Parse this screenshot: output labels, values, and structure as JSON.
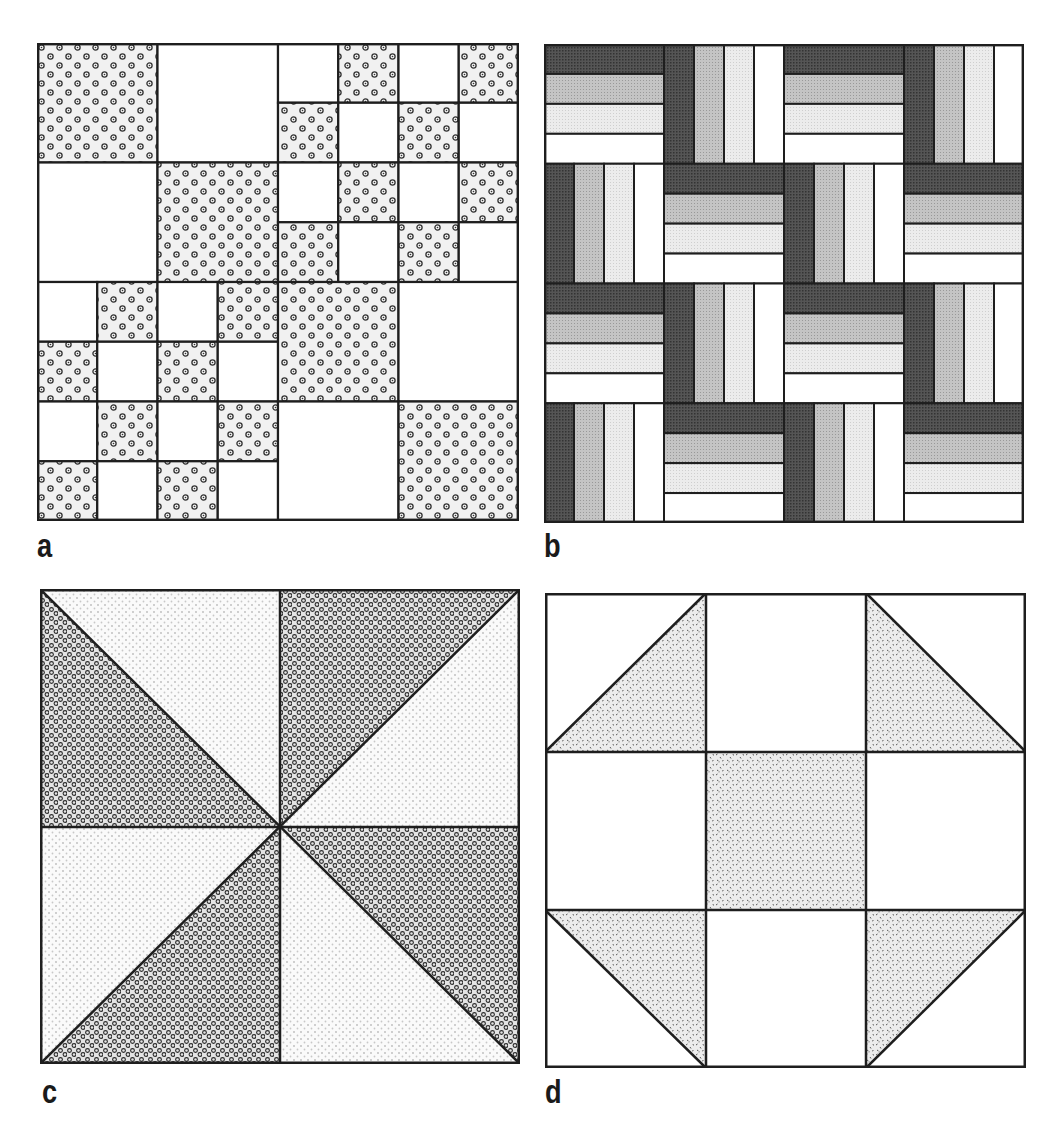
{
  "figure": {
    "panels": [
      {
        "id": "a",
        "label": "a",
        "name": "Double nine-patch style checkerboard block",
        "grid": 8,
        "fabric": "flower-print",
        "layout": {
          "quadrants": {
            "top_left": "large-2x2",
            "top_right": "checker-4x4",
            "bottom_left": "checker-4x4",
            "bottom_right": "large-2x2"
          }
        }
      },
      {
        "id": "b",
        "label": "b",
        "name": "Rail fence block",
        "grid": 4,
        "strips": [
          "dark",
          "medium",
          "light",
          "white"
        ],
        "orientation_rows": [
          [
            "H",
            "V",
            "H",
            "V"
          ],
          [
            "V",
            "H",
            "V",
            "H"
          ],
          [
            "H",
            "V",
            "H",
            "V"
          ],
          [
            "V",
            "H",
            "V",
            "H"
          ]
        ]
      },
      {
        "id": "c",
        "label": "c",
        "name": "Pinwheel block",
        "fabrics": [
          "dark-circle-print",
          "light-dot-print"
        ]
      },
      {
        "id": "d",
        "label": "d",
        "name": "Shoofly block",
        "fabric": "speckle-print"
      }
    ],
    "colors": {
      "line": "#1e1e1e",
      "strip_dark": "#4a4a4a",
      "strip_medium": "#b8b8b8",
      "strip_light": "#e6e6e6",
      "strip_white": "#ffffff",
      "background": "#ffffff"
    }
  }
}
